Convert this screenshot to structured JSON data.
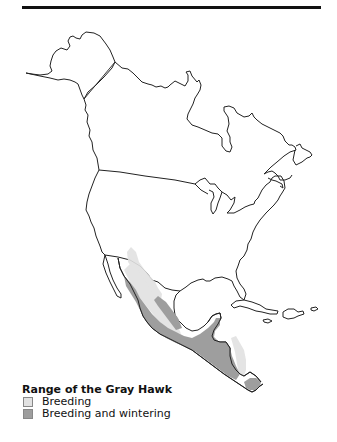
{
  "map": {
    "region": "North America",
    "colors": {
      "land": "#ffffff",
      "outline": "#222222",
      "breeding": "#dcdcdc",
      "breeding_and_wintering": "#9e9e9e"
    }
  },
  "legend": {
    "title": "Range of the Gray Hawk",
    "items": [
      {
        "label": "Breeding",
        "color": "#dcdcdc"
      },
      {
        "label": "Breeding and wintering",
        "color": "#9e9e9e"
      }
    ]
  }
}
